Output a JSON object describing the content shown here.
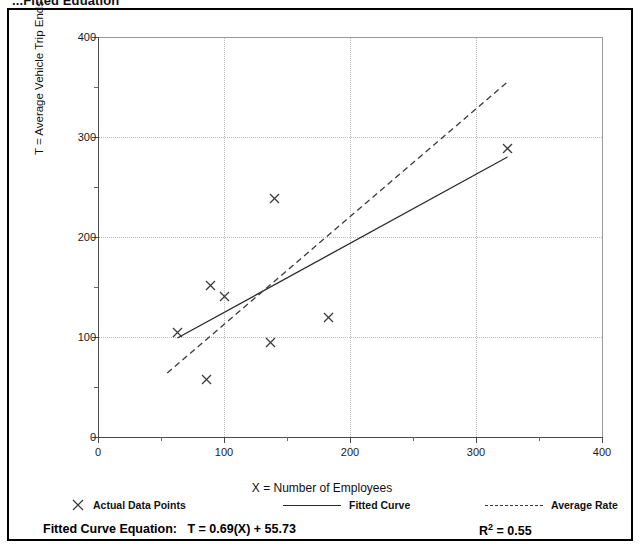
{
  "figure": {
    "title": "...Fitted Equation",
    "caption_equation_label": "Fitted Curve Equation:",
    "caption_equation_value": "T = 0.69(X) + 55.73",
    "r_squared_label": "R",
    "r_squared_exponent": "2",
    "r_squared_value": "= 0.55"
  },
  "legend": {
    "points_label": "Actual Data Points",
    "fitted_label": "Fitted Curve",
    "average_label": "Average Rate",
    "point_icon": "x-marker-icon",
    "fitted_icon": "solid-line-icon",
    "average_icon": "dashed-line-icon"
  },
  "chart_data": {
    "type": "scatter",
    "title": "...Fitted Equation",
    "xlabel": "X = Number of Employees",
    "ylabel": "T = Average Vehicle Trip Ends",
    "xlim": [
      0,
      400
    ],
    "ylim": [
      0,
      400
    ],
    "xticks": [
      0,
      100,
      200,
      300,
      400
    ],
    "xticklabels": [
      "0",
      "100",
      "200",
      "300",
      "400"
    ],
    "yticks": [
      0,
      100,
      200,
      300,
      400
    ],
    "yticklabels": [
      "0",
      "100",
      "200",
      "300",
      "400"
    ],
    "xminorticks": [
      50,
      150,
      250,
      350
    ],
    "yminorticks": [
      50,
      150,
      250,
      350
    ],
    "grid": true,
    "grid_style": "dotted",
    "legend_position": "below-axes",
    "series": [
      {
        "name": "Actual Data Points",
        "type": "scatter",
        "marker": "x",
        "color": "#3a3a3a",
        "points": [
          {
            "x": 63,
            "y": 105
          },
          {
            "x": 86,
            "y": 58
          },
          {
            "x": 89,
            "y": 152
          },
          {
            "x": 100,
            "y": 141
          },
          {
            "x": 137,
            "y": 95
          },
          {
            "x": 140,
            "y": 239
          },
          {
            "x": 183,
            "y": 120
          },
          {
            "x": 325,
            "y": 289
          }
        ]
      },
      {
        "name": "Fitted Curve",
        "type": "line",
        "style": "solid",
        "color": "#2a2a2a",
        "equation": "T = 0.69(X) + 55.73",
        "slope": 0.69,
        "intercept": 55.73,
        "r_squared": 0.55,
        "x_range": [
          63,
          325
        ],
        "points": [
          {
            "x": 63,
            "y": 99
          },
          {
            "x": 325,
            "y": 280
          }
        ]
      },
      {
        "name": "Average Rate",
        "type": "line",
        "style": "dashed",
        "color": "#3a3a3a",
        "x_range": [
          55,
          325
        ],
        "points": [
          {
            "x": 55,
            "y": 64
          },
          {
            "x": 325,
            "y": 355
          }
        ]
      }
    ]
  }
}
